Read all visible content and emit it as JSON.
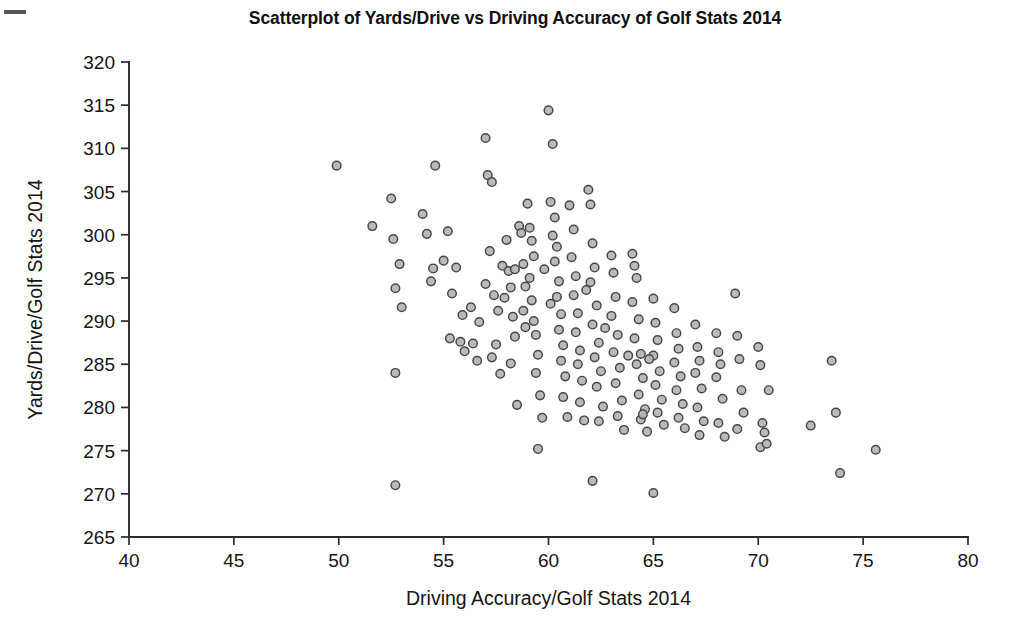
{
  "figure": {
    "title": "Scatterplot of Yards/Drive vs Driving Accuracy of Golf Stats 2014",
    "background_color": "#ffffff",
    "scan_artifact": "top-left-dash"
  },
  "chart_data": {
    "type": "scatter",
    "title": "Scatterplot of Yards/Drive vs Driving Accuracy of Golf Stats 2014",
    "xlabel": "Driving Accuracy/Golf Stats 2014",
    "ylabel": "Yards/Drive/Golf Stats 2014",
    "xlim": [
      40,
      80
    ],
    "ylim": [
      265,
      320
    ],
    "xticks": [
      40,
      45,
      50,
      55,
      60,
      65,
      70,
      75,
      80
    ],
    "yticks": [
      265,
      270,
      275,
      280,
      285,
      290,
      295,
      300,
      305,
      310,
      315,
      320
    ],
    "grid": false,
    "legend": null,
    "marker": {
      "shape": "circle",
      "size_px": 8.6,
      "fill_color": "#b4b4b4",
      "edge_color": "#474747"
    },
    "n_points": 186,
    "correlation": "negative",
    "series": [
      {
        "name": "PGA Tour players 2014",
        "points": [
          [
            49.9,
            308.0
          ],
          [
            51.6,
            301.0
          ],
          [
            52.5,
            304.2
          ],
          [
            52.7,
            293.8
          ],
          [
            52.6,
            299.5
          ],
          [
            52.9,
            296.6
          ],
          [
            53.0,
            291.6
          ],
          [
            52.7,
            284.0
          ],
          [
            52.7,
            271.0
          ],
          [
            54.0,
            302.4
          ],
          [
            54.2,
            300.1
          ],
          [
            54.6,
            308.0
          ],
          [
            54.5,
            296.1
          ],
          [
            54.4,
            294.6
          ],
          [
            55.0,
            297.0
          ],
          [
            55.2,
            300.4
          ],
          [
            55.4,
            293.2
          ],
          [
            55.6,
            296.2
          ],
          [
            55.3,
            288.0
          ],
          [
            55.8,
            287.6
          ],
          [
            55.9,
            290.7
          ],
          [
            56.0,
            286.5
          ],
          [
            56.3,
            291.6
          ],
          [
            56.4,
            287.4
          ],
          [
            56.6,
            285.4
          ],
          [
            56.7,
            289.9
          ],
          [
            57.0,
            311.2
          ],
          [
            57.1,
            306.9
          ],
          [
            57.3,
            306.1
          ],
          [
            57.2,
            298.1
          ],
          [
            57.0,
            294.3
          ],
          [
            57.4,
            293.0
          ],
          [
            57.3,
            285.8
          ],
          [
            57.6,
            291.2
          ],
          [
            57.5,
            287.3
          ],
          [
            57.8,
            296.4
          ],
          [
            57.9,
            292.7
          ],
          [
            57.7,
            283.9
          ],
          [
            58.0,
            299.4
          ],
          [
            58.1,
            295.8
          ],
          [
            58.2,
            293.9
          ],
          [
            58.3,
            290.5
          ],
          [
            58.4,
            288.2
          ],
          [
            58.2,
            285.1
          ],
          [
            58.5,
            280.3
          ],
          [
            58.6,
            301.0
          ],
          [
            58.7,
            300.2
          ],
          [
            58.8,
            296.6
          ],
          [
            58.9,
            294.0
          ],
          [
            58.8,
            291.2
          ],
          [
            58.9,
            289.3
          ],
          [
            59.0,
            303.6
          ],
          [
            59.1,
            300.8
          ],
          [
            59.2,
            299.3
          ],
          [
            59.3,
            297.5
          ],
          [
            59.1,
            295.0
          ],
          [
            59.2,
            292.4
          ],
          [
            59.3,
            290.0
          ],
          [
            59.4,
            288.4
          ],
          [
            59.5,
            286.1
          ],
          [
            59.4,
            284.0
          ],
          [
            59.6,
            281.4
          ],
          [
            59.7,
            278.8
          ],
          [
            59.5,
            275.2
          ],
          [
            60.0,
            314.4
          ],
          [
            60.2,
            310.5
          ],
          [
            60.1,
            303.8
          ],
          [
            60.3,
            302.0
          ],
          [
            60.2,
            299.9
          ],
          [
            60.4,
            298.6
          ],
          [
            60.3,
            296.9
          ],
          [
            60.5,
            294.6
          ],
          [
            60.4,
            292.8
          ],
          [
            60.6,
            290.8
          ],
          [
            60.5,
            289.0
          ],
          [
            60.7,
            287.2
          ],
          [
            60.6,
            285.4
          ],
          [
            60.8,
            283.6
          ],
          [
            60.7,
            281.2
          ],
          [
            60.9,
            278.9
          ],
          [
            61.0,
            303.4
          ],
          [
            61.2,
            300.6
          ],
          [
            61.1,
            297.4
          ],
          [
            61.3,
            295.2
          ],
          [
            61.2,
            293.0
          ],
          [
            61.4,
            290.9
          ],
          [
            61.3,
            288.7
          ],
          [
            61.5,
            286.6
          ],
          [
            61.4,
            285.0
          ],
          [
            61.6,
            283.1
          ],
          [
            61.5,
            280.6
          ],
          [
            61.7,
            278.5
          ],
          [
            61.9,
            305.2
          ],
          [
            62.0,
            303.5
          ],
          [
            62.1,
            299.0
          ],
          [
            62.2,
            296.2
          ],
          [
            62.0,
            294.5
          ],
          [
            62.3,
            291.8
          ],
          [
            62.1,
            289.6
          ],
          [
            62.4,
            287.5
          ],
          [
            62.2,
            285.8
          ],
          [
            62.5,
            284.2
          ],
          [
            62.3,
            282.4
          ],
          [
            62.6,
            280.1
          ],
          [
            62.4,
            278.4
          ],
          [
            62.1,
            271.5
          ],
          [
            63.0,
            297.6
          ],
          [
            63.1,
            295.6
          ],
          [
            63.2,
            292.8
          ],
          [
            63.0,
            290.6
          ],
          [
            63.3,
            288.4
          ],
          [
            63.1,
            286.4
          ],
          [
            63.4,
            284.6
          ],
          [
            63.2,
            282.8
          ],
          [
            63.5,
            280.8
          ],
          [
            63.3,
            279.0
          ],
          [
            63.6,
            277.4
          ],
          [
            64.0,
            297.8
          ],
          [
            64.1,
            296.4
          ],
          [
            64.2,
            295.0
          ],
          [
            64.0,
            292.2
          ],
          [
            64.3,
            290.2
          ],
          [
            64.1,
            288.0
          ],
          [
            64.4,
            286.2
          ],
          [
            64.2,
            285.0
          ],
          [
            64.5,
            283.4
          ],
          [
            64.3,
            281.5
          ],
          [
            64.6,
            279.8
          ],
          [
            64.4,
            278.6
          ],
          [
            64.7,
            277.2
          ],
          [
            64.5,
            279.2
          ],
          [
            65.0,
            292.6
          ],
          [
            65.1,
            289.8
          ],
          [
            65.2,
            287.8
          ],
          [
            65.0,
            286.0
          ],
          [
            65.3,
            284.2
          ],
          [
            65.1,
            282.6
          ],
          [
            65.4,
            280.9
          ],
          [
            65.2,
            279.4
          ],
          [
            65.5,
            278.0
          ],
          [
            65.0,
            270.1
          ],
          [
            66.0,
            291.5
          ],
          [
            66.1,
            288.6
          ],
          [
            66.2,
            286.8
          ],
          [
            66.0,
            285.2
          ],
          [
            66.3,
            283.6
          ],
          [
            66.1,
            282.0
          ],
          [
            66.4,
            280.4
          ],
          [
            66.2,
            278.8
          ],
          [
            66.5,
            277.6
          ],
          [
            67.0,
            289.6
          ],
          [
            67.1,
            287.0
          ],
          [
            67.2,
            285.4
          ],
          [
            67.0,
            284.0
          ],
          [
            67.3,
            282.2
          ],
          [
            67.1,
            280.0
          ],
          [
            67.4,
            278.4
          ],
          [
            67.2,
            276.8
          ],
          [
            68.0,
            288.6
          ],
          [
            68.1,
            286.4
          ],
          [
            68.2,
            285.0
          ],
          [
            68.0,
            283.5
          ],
          [
            68.3,
            281.0
          ],
          [
            68.1,
            278.2
          ],
          [
            68.4,
            276.6
          ],
          [
            68.9,
            293.2
          ],
          [
            69.0,
            288.3
          ],
          [
            69.1,
            285.6
          ],
          [
            69.2,
            282.0
          ],
          [
            69.3,
            279.4
          ],
          [
            69.0,
            277.5
          ],
          [
            70.0,
            287.0
          ],
          [
            70.1,
            284.9
          ],
          [
            70.2,
            278.2
          ],
          [
            70.3,
            277.1
          ],
          [
            70.1,
            275.4
          ],
          [
            70.4,
            275.8
          ],
          [
            70.5,
            282.0
          ],
          [
            72.5,
            277.9
          ],
          [
            73.5,
            285.4
          ],
          [
            73.7,
            279.4
          ],
          [
            73.9,
            272.4
          ],
          [
            75.6,
            275.1
          ],
          [
            59.8,
            296.0
          ],
          [
            61.8,
            293.6
          ],
          [
            63.8,
            286.0
          ],
          [
            64.8,
            285.6
          ],
          [
            62.7,
            289.2
          ],
          [
            60.1,
            292.0
          ],
          [
            58.4,
            296.0
          ]
        ]
      }
    ]
  },
  "axes": {
    "x_title": "Driving Accuracy/Golf Stats 2014",
    "y_title": "Yards/Drive/Golf Stats 2014",
    "x_tick_labels": [
      "40",
      "45",
      "50",
      "55",
      "60",
      "65",
      "70",
      "75",
      "80"
    ],
    "y_tick_labels": [
      "265",
      "270",
      "275",
      "280",
      "285",
      "290",
      "295",
      "300",
      "305",
      "310",
      "315",
      "320"
    ]
  }
}
